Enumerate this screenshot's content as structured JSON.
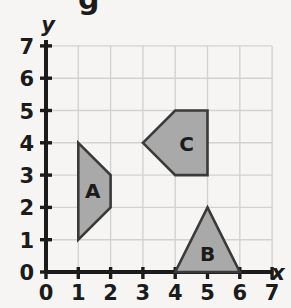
{
  "figure": {
    "title_partial_glyph": "g",
    "background_color": "#f6f5f3",
    "grid_color": "#d2d2d2",
    "axis_color": "#1b1b1b",
    "shape_fill": "#a9a9a9",
    "shape_stroke": "#3a3a3a"
  },
  "axes": {
    "x": {
      "label": "x",
      "min": 0,
      "max": 7,
      "ticks": [
        "0",
        "1",
        "2",
        "3",
        "4",
        "5",
        "6",
        "7"
      ]
    },
    "y": {
      "label": "y",
      "min": 0,
      "max": 7,
      "ticks": [
        "0",
        "1",
        "2",
        "3",
        "4",
        "5",
        "6",
        "7"
      ]
    }
  },
  "chart_data": {
    "type": "scatter",
    "title": "",
    "xlabel": "x",
    "ylabel": "y",
    "xlim": [
      0,
      7
    ],
    "ylim": [
      0,
      7
    ],
    "grid": true,
    "legend": "none",
    "xticks": [
      0,
      1,
      2,
      3,
      4,
      5,
      6,
      7
    ],
    "yticks": [
      0,
      1,
      2,
      3,
      4,
      5,
      6,
      7
    ],
    "shapes": [
      {
        "label": "A",
        "kind": "quadrilateral",
        "vertices": [
          [
            1,
            4
          ],
          [
            2,
            3
          ],
          [
            2,
            2
          ],
          [
            1,
            1
          ]
        ],
        "label_position": [
          1.45,
          2.55
        ],
        "fill": "#a9a9a9",
        "stroke": "#3a3a3a"
      },
      {
        "label": "B",
        "kind": "triangle",
        "vertices": [
          [
            4,
            0
          ],
          [
            5,
            2
          ],
          [
            6,
            0
          ]
        ],
        "label_position": [
          5,
          0.6
        ],
        "fill": "#a9a9a9",
        "stroke": "#3a3a3a"
      },
      {
        "label": "C",
        "kind": "pentagon",
        "vertices": [
          [
            3,
            4
          ],
          [
            4,
            5
          ],
          [
            5,
            5
          ],
          [
            5,
            3
          ],
          [
            4,
            3
          ]
        ],
        "label_position": [
          4.35,
          4.0
        ],
        "fill": "#a9a9a9",
        "stroke": "#3a3a3a"
      }
    ]
  }
}
